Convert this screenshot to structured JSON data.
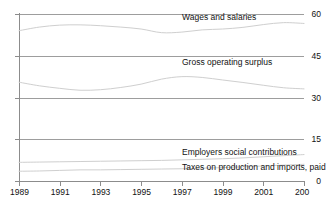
{
  "chart_data": {
    "type": "line",
    "title": "",
    "title_fragment_clipped": "",
    "xlabel": "",
    "ylabel": "",
    "xlim": [
      1989,
      2003
    ],
    "ylim": [
      0,
      60
    ],
    "grid": true,
    "legend_position": "inline-annotations",
    "yticks": [
      0,
      15,
      30,
      45,
      60
    ],
    "ytick_labels": [
      "0",
      "15",
      "30",
      "45",
      "60"
    ],
    "xticks": [
      1989,
      1991,
      1993,
      1995,
      1997,
      1999,
      2001,
      2003
    ],
    "xtick_labels": [
      "1989",
      "1991",
      "1993",
      "1995",
      "1997",
      "1999",
      "2001",
      "200"
    ],
    "x": [
      1989,
      1990,
      1991,
      1992,
      1993,
      1994,
      1995,
      1996,
      1997,
      1998,
      1999,
      2000,
      2001,
      2002,
      2003
    ],
    "series": [
      {
        "name": "Wages and salaries",
        "color": "#cfcfcf",
        "values": [
          54.0,
          55.3,
          56.0,
          56.1,
          55.8,
          55.3,
          54.6,
          53.3,
          53.5,
          54.3,
          54.6,
          55.2,
          56.2,
          56.9,
          56.6
        ]
      },
      {
        "name": "Gross operating surplus",
        "color": "#cfcfcf",
        "values": [
          35.5,
          34.2,
          33.3,
          32.6,
          32.8,
          33.6,
          34.8,
          36.6,
          37.5,
          37.2,
          36.3,
          35.4,
          34.4,
          33.5,
          33.1
        ]
      },
      {
        "name": "Employers social contributions",
        "color": "#cfcfcf",
        "values": [
          6.7,
          6.8,
          6.9,
          7.0,
          7.1,
          7.2,
          7.3,
          7.4,
          7.6,
          7.8,
          8.0,
          8.3,
          8.7,
          9.1,
          9.5
        ]
      },
      {
        "name": "Taxes on production and imports, paid",
        "color": "#cfcfcf",
        "values": [
          3.5,
          3.6,
          3.8,
          4.0,
          4.0,
          4.1,
          4.2,
          4.3,
          4.4,
          4.6,
          4.8,
          5.1,
          5.4,
          5.7,
          6.0
        ]
      }
    ],
    "annotations": [
      {
        "text": "Wages and salaries",
        "x_px": 182,
        "y_px": 13
      },
      {
        "text": "Gross operating surplus",
        "x_px": 182,
        "y_px": 58
      },
      {
        "text": "Employers social contributions",
        "x_px": 182,
        "y_px": 148
      },
      {
        "text": "Taxes on production and imports, paid",
        "x_px": 182,
        "y_px": 163
      }
    ],
    "colors": {
      "line": "#cfcfcf",
      "grid": "#8c8c8c",
      "axis": "#8c8c8c",
      "text": "#111111",
      "background": "#ffffff"
    }
  }
}
